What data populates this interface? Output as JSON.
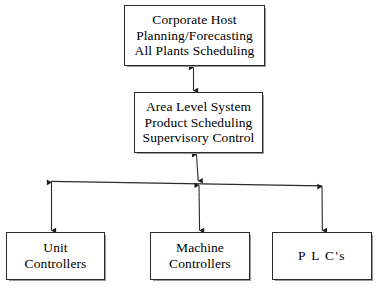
{
  "diagram": {
    "background_color": "#ffffff",
    "line_color": "#2b2b2b",
    "nodes": [
      {
        "id": "corporate-host",
        "lines": [
          "Corporate Host",
          "Planning/Forecasting",
          "All Plants Scheduling"
        ]
      },
      {
        "id": "area-level",
        "lines": [
          "Area Level System",
          "Product Scheduling",
          "Supervisory Control"
        ]
      },
      {
        "id": "unit-controllers",
        "lines": [
          "Unit",
          "Controllers"
        ]
      },
      {
        "id": "machine-controllers",
        "lines": [
          "Machine",
          "Controllers"
        ]
      },
      {
        "id": "plcs",
        "lines": [
          "P L C's"
        ]
      }
    ],
    "connectors": [
      {
        "id": "corporate-to-area",
        "kind": "bidirectional-vertical",
        "from": "corporate-host",
        "to": "area-level"
      },
      {
        "id": "area-to-bus",
        "kind": "bidirectional-vertical",
        "from": "area-level",
        "to": "distribution-bus"
      },
      {
        "id": "distribution-bus",
        "kind": "horizontal-bus"
      },
      {
        "id": "bus-to-unit-controllers",
        "kind": "bidirectional-vertical",
        "from": "distribution-bus",
        "to": "unit-controllers"
      },
      {
        "id": "bus-to-machine-controllers",
        "kind": "bidirectional-vertical",
        "from": "distribution-bus",
        "to": "machine-controllers"
      },
      {
        "id": "bus-to-plcs",
        "kind": "bidirectional-vertical",
        "from": "distribution-bus",
        "to": "plcs"
      }
    ]
  }
}
